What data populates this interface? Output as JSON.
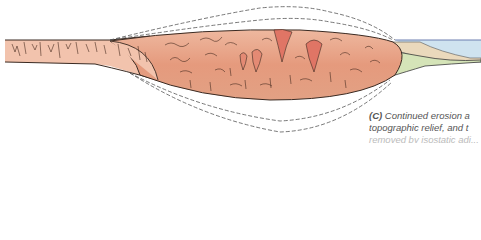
{
  "figure": {
    "panel_label": "(C)",
    "caption_lines": [
      "Continued erosion a",
      "topographic relief, and t",
      "removed by isostatic adj..."
    ],
    "colors": {
      "crust_light": "#f2c3ad",
      "crust_mid": "#e9a58a",
      "crust_deep": "#dd8a6e",
      "intrusion": "#e07565",
      "outline": "#3a2a22",
      "dashed_outline": "#555555",
      "sea": "#cfe3ef",
      "sediment_tan": "#ead9bc",
      "sediment_green": "#d5e4b8",
      "background": "#ffffff"
    },
    "layers": [
      "eroded-former-mountain-outline-dashed",
      "former-root-outline-dashed",
      "continental-crust-left",
      "orogenic-core-root",
      "granitic-intrusions",
      "sedimentary-wedge",
      "ocean"
    ]
  }
}
